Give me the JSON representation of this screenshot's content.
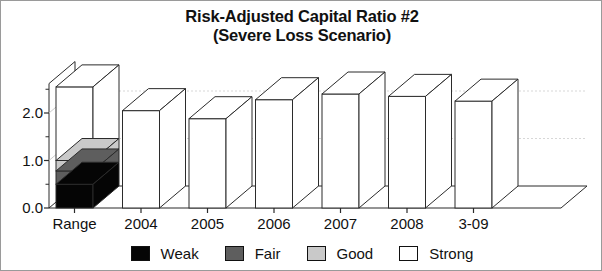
{
  "chart_data": {
    "type": "bar",
    "title": "Risk-Adjusted Capital Ratio #2",
    "subtitle": "(Severe Loss Scenario)",
    "xlabel": "",
    "ylabel": "",
    "categories": [
      "Range",
      "2004",
      "2005",
      "2006",
      "2007",
      "2008",
      "3-09"
    ],
    "ytick_labels": [
      "0.0",
      "1.0",
      "2.0"
    ],
    "ytick_values": [
      0.0,
      1.0,
      2.0
    ],
    "ylim": [
      0.0,
      2.7
    ],
    "grid": true,
    "legend_position": "bottom",
    "legend": [
      "Weak",
      "Fair",
      "Good",
      "Strong"
    ],
    "series": [
      {
        "name": "Weak",
        "color": "#050505",
        "values": [
          0.5,
          0,
          0,
          0,
          0,
          0,
          0
        ]
      },
      {
        "name": "Fair",
        "color": "#5e5e5e",
        "values": [
          0.28,
          0,
          0,
          0,
          0,
          0,
          0
        ]
      },
      {
        "name": "Good",
        "color": "#c9c9c9",
        "values": [
          0.22,
          0,
          0,
          0,
          0,
          0,
          0
        ]
      },
      {
        "name": "Strong",
        "color": "#ffffff",
        "values": [
          1.55,
          2.05,
          1.88,
          2.28,
          2.4,
          2.35,
          2.25
        ]
      }
    ],
    "bar_totals": [
      2.55,
      2.05,
      1.88,
      2.28,
      2.4,
      2.35,
      2.25
    ],
    "range_bar_boundaries": [
      0.0,
      0.5,
      0.78,
      1.0,
      2.55
    ],
    "style": "3d-column"
  },
  "legend": {
    "items": [
      {
        "label": "Weak",
        "color": "#050505"
      },
      {
        "label": "Fair",
        "color": "#5e5e5e"
      },
      {
        "label": "Good",
        "color": "#c9c9c9"
      },
      {
        "label": "Strong",
        "color": "#ffffff"
      }
    ]
  }
}
